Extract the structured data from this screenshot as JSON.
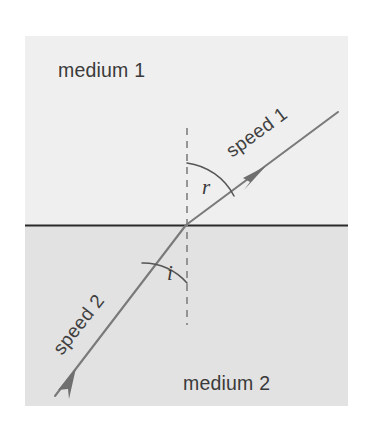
{
  "figure": {
    "background_color": "#ffffff"
  },
  "panel": {
    "x": 25,
    "y": 36,
    "width": 323,
    "height": 370,
    "upper_fill": "#f2f2f2",
    "lower_fill": "#e5e5e5"
  },
  "labels": {
    "medium_upper": "medium 1",
    "medium_lower": "medium 2",
    "speed_upper": "speed 1",
    "speed_lower": "speed 2",
    "angle_refraction": "r",
    "angle_incidence": "i"
  },
  "geometry": {
    "interface_y": 225,
    "normal_x": 187,
    "normal_top_y": 128,
    "normal_bottom_y": 325,
    "refraction_point_x": 186,
    "refraction_point_y": 225,
    "refracted_ray_end_x": 338,
    "refracted_ray_end_y": 113,
    "incident_ray_start_x": 55,
    "incident_ray_start_y": 395,
    "refracted_arrow_x": 262,
    "refracted_arrow_y": 169,
    "incident_arrow_x": 73,
    "incident_arrow_y": 373,
    "arc_r_radius": 62,
    "arc_i_radius": 58,
    "speed1_rotation_deg": -36,
    "speed2_rotation_deg": -52
  },
  "colors": {
    "ray": "#7a7a7a",
    "interface": "#2b2b2b",
    "normal": "#8c8c8c",
    "arc": "#555555",
    "text": "#3a3a3a"
  },
  "positions": {
    "medium1_x": 58,
    "medium1_y": 77,
    "medium2_x": 183,
    "medium2_y": 390,
    "speed1_x": 232,
    "speed1_y": 158,
    "speed2_x": 62,
    "speed2_y": 355,
    "angle_r_x": 202,
    "angle_r_y": 193,
    "angle_i_x": 166,
    "angle_i_y": 280
  }
}
